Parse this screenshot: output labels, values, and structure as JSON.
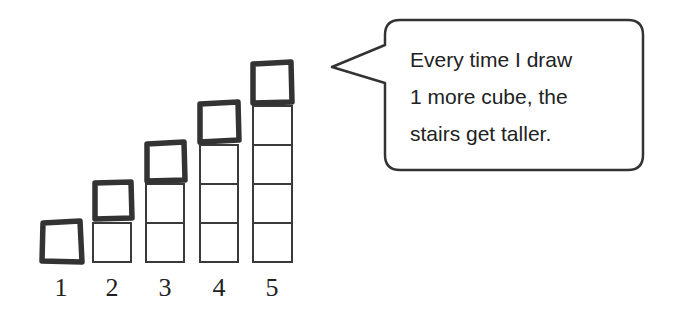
{
  "figure": {
    "columns": [
      {
        "label": "1",
        "cubes": 1
      },
      {
        "label": "2",
        "cubes": 2
      },
      {
        "label": "3",
        "cubes": 3
      },
      {
        "label": "4",
        "cubes": 4
      },
      {
        "label": "5",
        "cubes": 5
      }
    ],
    "colors": {
      "stroke": "#333333",
      "background": "#ffffff"
    }
  },
  "speech_bubble": {
    "lines": [
      "Every time I draw",
      "1 more cube, the",
      "stairs get taller."
    ]
  }
}
